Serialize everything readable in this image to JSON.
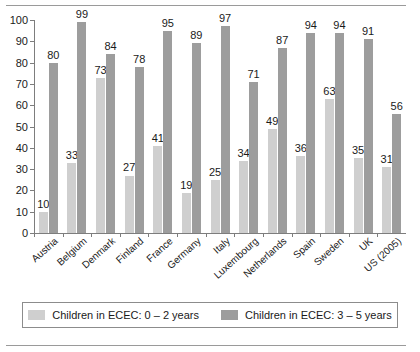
{
  "frame": {
    "top_rule": "horizontal-rule",
    "bottom_rule": "horizontal-rule"
  },
  "legend": {
    "position": "bottom",
    "items": [
      {
        "label": "Children in ECEC: 0 – 2 years",
        "color": "#cfcfcf",
        "swatch": "legend-swatch-light"
      },
      {
        "label": "Children in ECEC: 3 – 5 years",
        "color": "#9d9d9d",
        "swatch": "legend-swatch-dark"
      }
    ]
  },
  "chart_data": {
    "type": "bar",
    "title": "",
    "xlabel": "",
    "ylabel": "",
    "ylim": [
      0,
      100
    ],
    "yticks": [
      0,
      10,
      20,
      30,
      40,
      50,
      60,
      70,
      80,
      90,
      100
    ],
    "grid": false,
    "legend_position": "bottom",
    "categories": [
      "Austria",
      "Belgium",
      "Denmark",
      "Finland",
      "France",
      "Germany",
      "Italy",
      "Luxembourg",
      "Netherlands",
      "Spain",
      "Sweden",
      "UK",
      "US (2005)"
    ],
    "series": [
      {
        "name": "Children in ECEC: 0 – 2 years",
        "color": "#cfcfcf",
        "values": [
          10,
          33,
          73,
          27,
          41,
          19,
          25,
          34,
          49,
          36,
          63,
          35,
          31
        ]
      },
      {
        "name": "Children in ECEC: 3 – 5 years",
        "color": "#9d9d9d",
        "values": [
          80,
          99,
          84,
          78,
          95,
          89,
          97,
          71,
          87,
          94,
          94,
          91,
          56
        ]
      }
    ]
  }
}
